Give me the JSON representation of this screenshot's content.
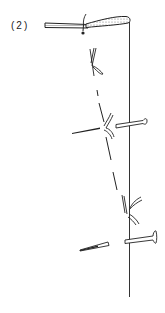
{
  "figure": {
    "step_label": "(2)",
    "colors": {
      "ink": "#222222",
      "stipple": "#9a9a9a",
      "background": "#ffffff"
    },
    "elements": {
      "fabric_edge": "top horizontal fabric band with stippled fold",
      "fold_line": "vertical line",
      "stitch_line": "dashed diagonal stitch line",
      "knot": "thread knot at top",
      "pins": [
        "upper pin",
        "lower pin"
      ],
      "stitch_marks": [
        "upper stitch mark",
        "middle stitch mark",
        "lower stitch mark"
      ],
      "needles": [
        "upper needle stroke",
        "lower needle stroke"
      ]
    }
  }
}
